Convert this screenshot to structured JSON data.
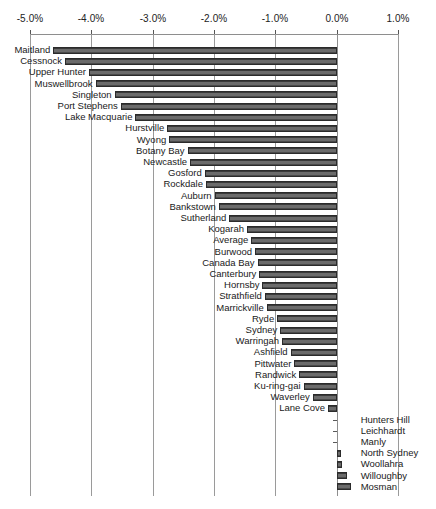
{
  "chart_data": {
    "type": "bar",
    "orientation": "horizontal",
    "title": "",
    "subtitle": "",
    "xlabel": "",
    "ylabel": "",
    "xlim": [
      -5.0,
      1.0
    ],
    "grid": true,
    "legend": null,
    "xticks": [
      "-5.0%",
      "-4.0%",
      "-3.0%",
      "-2.0%",
      "-1.0%",
      "0.0%",
      "1.0%"
    ],
    "xtick_values": [
      -5.0,
      -4.0,
      -3.0,
      -2.0,
      -1.0,
      0.0,
      1.0
    ],
    "units": "percent",
    "categories": [
      "Maitland",
      "Cessnock",
      "Upper Hunter",
      "Muswellbrook",
      "Singleton",
      "Port Stephens",
      "Lake Macquarie",
      "Hurstville",
      "Wyong",
      "Botany Bay",
      "Newcastle",
      "Gosford",
      "Rockdale",
      "Auburn",
      "Bankstown",
      "Sutherland",
      "Kogarah",
      "Average",
      "Burwood",
      "Canada Bay",
      "Canterbury",
      "Hornsby",
      "Strathfield",
      "Marrickville",
      "Ryde",
      "Sydney",
      "Warringah",
      "Ashfield",
      "Pittwater",
      "Randwick",
      "Ku-ring-gai",
      "Waverley",
      "Lane Cove",
      "Hunters Hill",
      "Leichhardt",
      "Manly",
      "North Sydney",
      "Woollahra",
      "Willoughby",
      "Mosman"
    ],
    "values": [
      -4.62,
      -4.43,
      -4.04,
      -3.93,
      -3.62,
      -3.52,
      -3.28,
      -2.76,
      -2.73,
      -2.43,
      -2.39,
      -2.15,
      -2.13,
      -1.99,
      -1.92,
      -1.75,
      -1.46,
      -1.39,
      -1.33,
      -1.29,
      -1.26,
      -1.21,
      -1.17,
      -1.14,
      -0.97,
      -0.92,
      -0.89,
      -0.75,
      -0.69,
      -0.61,
      -0.54,
      -0.39,
      -0.14,
      -0.02,
      -0.01,
      0.0,
      0.07,
      0.08,
      0.17,
      0.23
    ],
    "label_side": [
      "left",
      "left",
      "left",
      "left",
      "left",
      "left",
      "left",
      "left",
      "left",
      "left",
      "left",
      "left",
      "left",
      "left",
      "left",
      "left",
      "left",
      "left",
      "left",
      "left",
      "left",
      "left",
      "left",
      "left",
      "left",
      "left",
      "left",
      "left",
      "left",
      "left",
      "left",
      "left",
      "left",
      "right",
      "right",
      "right",
      "right",
      "right",
      "right",
      "right"
    ],
    "bar_color": "#5d5d5d",
    "bar_edge_color": "#2b2b2b",
    "grid_color": "#9a9a9a",
    "axis_color": "#8e8e8e"
  }
}
